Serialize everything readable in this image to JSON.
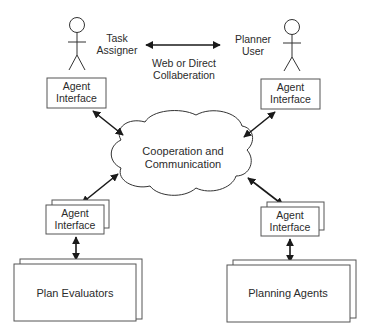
{
  "diagram": {
    "actors": {
      "task_assigner": {
        "label_line1": "Task",
        "label_line2": "Assigner"
      },
      "planner_user": {
        "label_line1": "Planner",
        "label_line2": "User"
      }
    },
    "collaboration": {
      "label_line1": "Web or Direct",
      "label_line2": "Collaberation"
    },
    "cloud": {
      "label_line1": "Cooperation and",
      "label_line2": "Communication"
    },
    "agent_interface": {
      "label_line1": "Agent",
      "label_line2": "Interface"
    },
    "plan_evaluators": {
      "label": "Plan Evaluators"
    },
    "planning_agents": {
      "label": "Planning Agents"
    },
    "colors": {
      "stroke": "#333333",
      "text": "#2b2b2b",
      "background": "#ffffff"
    }
  }
}
